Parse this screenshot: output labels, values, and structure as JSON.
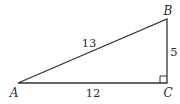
{
  "diagram": {
    "type": "right-triangle",
    "vertices": [
      {
        "id": "A",
        "label": "A"
      },
      {
        "id": "B",
        "label": "B"
      },
      {
        "id": "C",
        "label": "C"
      }
    ],
    "sides": [
      {
        "id": "AB",
        "label": "13"
      },
      {
        "id": "AC",
        "label": "12"
      },
      {
        "id": "BC",
        "label": "5"
      }
    ],
    "right_angle_at": "C",
    "colors": {
      "stroke": "#333333",
      "text": "#2a2a2a",
      "background": "#ffffff"
    }
  }
}
